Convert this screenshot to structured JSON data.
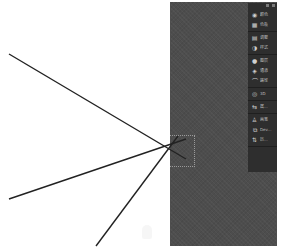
{
  "canvas": {
    "background": "#ffffff",
    "workspace_color": "#4d4d4d",
    "lines": [
      {
        "x1": 9,
        "y1": 54,
        "x2": 186,
        "y2": 159
      },
      {
        "x1": 9,
        "y1": 199,
        "x2": 186,
        "y2": 139
      },
      {
        "x1": 96,
        "y1": 246,
        "x2": 178,
        "y2": 136
      }
    ],
    "stroke_color": "#222222"
  },
  "dock": {
    "header": {
      "collapse": "collapse-icon",
      "close": "close-icon"
    },
    "groups": [
      {
        "items": [
          {
            "icon": "color-icon",
            "glyph": "◉",
            "label": "颜色"
          },
          {
            "icon": "swatches-icon",
            "glyph": "▦",
            "label": "色板"
          }
        ]
      },
      {
        "items": [
          {
            "icon": "adjustments-icon",
            "glyph": "▤",
            "label": "调整"
          },
          {
            "icon": "styles-icon",
            "glyph": "◑",
            "label": "样式"
          }
        ]
      },
      {
        "items": [
          {
            "icon": "layers-icon",
            "glyph": "●",
            "label": "图层"
          },
          {
            "icon": "channels-icon",
            "glyph": "◈",
            "label": "通道"
          },
          {
            "icon": "paths-icon",
            "glyph": "⌒",
            "label": "路径"
          }
        ]
      },
      {
        "items": [
          {
            "icon": "3d-icon",
            "glyph": "◎",
            "label": "3D"
          }
        ]
      },
      {
        "items": [
          {
            "icon": "properties-icon",
            "glyph": "⇆",
            "label": "属..."
          }
        ]
      },
      {
        "items": [
          {
            "icon": "brush-icon",
            "glyph": "♙",
            "label": "画笔"
          },
          {
            "icon": "clone-source-icon",
            "glyph": "⧉",
            "label": "Dev..."
          },
          {
            "icon": "history-icon",
            "glyph": "⇅",
            "label": "历..."
          }
        ]
      }
    ]
  }
}
